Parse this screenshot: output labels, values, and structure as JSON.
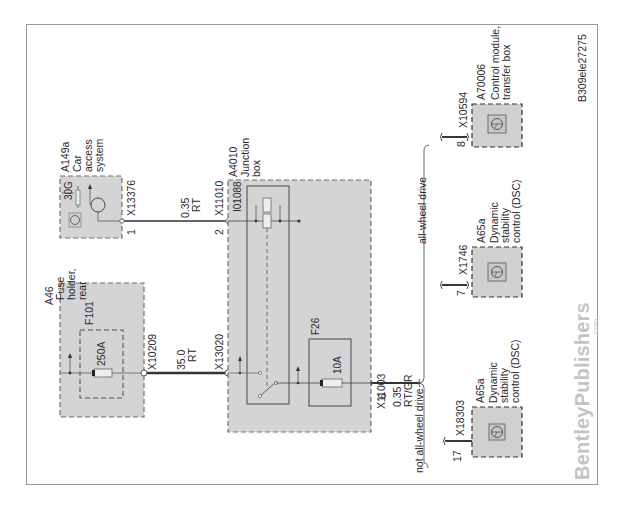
{
  "diagram": {
    "figure_id": "B309ele27275",
    "watermark": {
      "brand": "BentleyPublishers",
      "suffix": ".com"
    },
    "components": [
      {
        "id": "A46",
        "name_lines": [
          "Fuse",
          "holder,",
          "rear"
        ],
        "fuse": {
          "id": "F101",
          "rating": "250A"
        }
      },
      {
        "id": "A149a",
        "name_lines": [
          "Car",
          "access",
          "system"
        ],
        "terminal": "30G"
      },
      {
        "id": "A4010",
        "name_lines": [
          "Junction",
          "box"
        ],
        "relay": "I01088",
        "fuse": {
          "id": "F26",
          "rating": "10A"
        }
      },
      {
        "id": "A65a",
        "name_lines": [
          "Dynamic",
          "stability",
          "control (DSC)"
        ],
        "variant": "not all-wheel drive"
      },
      {
        "id": "A65a",
        "name_lines": [
          "Dynamic",
          "stability",
          "control (DSC)"
        ],
        "variant": "all-wheel drive"
      },
      {
        "id": "A70006",
        "name_lines": [
          "Control module,",
          "transfer box"
        ],
        "variant": "all-wheel drive"
      }
    ],
    "connectors": [
      {
        "id": "X10209",
        "pin": ""
      },
      {
        "id": "X13020",
        "pin": ""
      },
      {
        "id": "X13376",
        "pin": "1"
      },
      {
        "id": "X11010",
        "pin": "2"
      },
      {
        "id": "X11003",
        "pin": "6"
      },
      {
        "id": "X18303",
        "pin": "17"
      },
      {
        "id": "X1746",
        "pin": "7"
      },
      {
        "id": "X10594",
        "pin": "8"
      }
    ],
    "wires": [
      {
        "size": "35.0",
        "color": "RT"
      },
      {
        "size": "0.35",
        "color": "RT"
      },
      {
        "size": "0.35",
        "color": "RT/GR"
      }
    ],
    "variants": {
      "not_awd": "not all-wheel drive",
      "awd": "all-wheel drive"
    }
  }
}
